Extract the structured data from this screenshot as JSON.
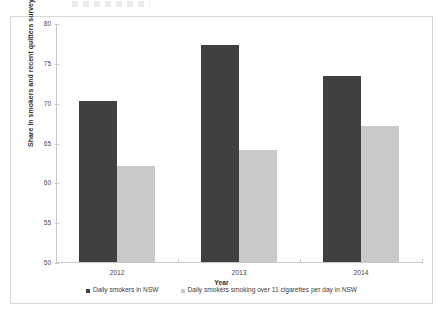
{
  "chart_data": {
    "type": "bar",
    "title": "",
    "subtitle": "",
    "xlabel": "Year",
    "ylabel": "Share in smokers and recent quitters surveyed (%)",
    "categories": [
      "2012",
      "2013",
      "2014"
    ],
    "series": [
      {
        "name": "Daily smokers in NSW",
        "color": "#404040",
        "values": [
          70.2,
          77.3,
          73.3
        ]
      },
      {
        "name": "Daily smokers smoking over 11 cigarettes per day in NSW",
        "color": "#c9c9c9",
        "values": [
          62.0,
          64.1,
          67.1
        ]
      }
    ],
    "ylim": [
      50,
      80
    ],
    "yticks": [
      50,
      55,
      60,
      65,
      70,
      75,
      80
    ],
    "ytick_labels": [
      "50",
      "55",
      "60",
      "65",
      "70",
      "75",
      "80"
    ],
    "grid": false,
    "legend_position": "bottom",
    "data_labels": false,
    "background_color": "#ffffff",
    "axis_color": "#c9c9c9"
  }
}
